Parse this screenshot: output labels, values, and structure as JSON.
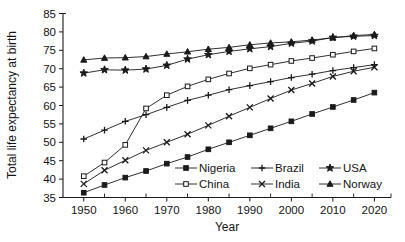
{
  "chart_data": {
    "type": "line",
    "title": "",
    "xlabel": "Year",
    "ylabel": "Total life expectancy at birth",
    "xlim": [
      1945,
      2024
    ],
    "ylim": [
      35,
      85
    ],
    "ytick_step": 5,
    "xtick_step": 10,
    "grid": false,
    "legend_position": "inside-lower-right",
    "yticks": [
      "35",
      "40",
      "45",
      "50",
      "55",
      "60",
      "65",
      "70",
      "75",
      "80",
      "85"
    ],
    "xticks": [
      "1950",
      "1960",
      "1970",
      "1980",
      "1990",
      "2000",
      "2010",
      "2020"
    ],
    "x": [
      1950,
      1955,
      1960,
      1965,
      1970,
      1975,
      1980,
      1985,
      1990,
      1995,
      2000,
      2005,
      2010,
      2015,
      2020
    ],
    "series": [
      {
        "name": "Nigeria",
        "marker": "filled-square",
        "values": [
          36.3,
          38.4,
          40.4,
          42.2,
          44.2,
          46.0,
          48.1,
          50.0,
          51.9,
          53.8,
          55.7,
          57.7,
          59.6,
          61.5,
          63.5
        ]
      },
      {
        "name": "China",
        "marker": "open-square",
        "values": [
          40.8,
          44.5,
          49.3,
          59.2,
          62.8,
          65.2,
          67.1,
          68.7,
          70.1,
          71.1,
          72.1,
          72.9,
          73.8,
          74.7,
          75.5
        ]
      },
      {
        "name": "Brazil",
        "marker": "plus",
        "values": [
          50.9,
          53.3,
          55.7,
          57.5,
          59.5,
          61.4,
          62.8,
          64.3,
          65.4,
          66.5,
          67.6,
          68.5,
          69.5,
          70.3,
          71.1
        ]
      },
      {
        "name": "India",
        "marker": "cross",
        "values": [
          38.7,
          42.4,
          45.1,
          47.8,
          50.0,
          52.2,
          54.6,
          57.1,
          59.5,
          61.9,
          64.2,
          66.0,
          67.9,
          69.3,
          70.4
        ]
      },
      {
        "name": "USA",
        "marker": "star",
        "values": [
          68.8,
          69.7,
          69.6,
          69.9,
          70.9,
          72.6,
          73.8,
          74.7,
          75.4,
          76.0,
          76.9,
          77.5,
          78.5,
          78.8,
          79.0
        ]
      },
      {
        "name": "Norway",
        "marker": "filled-triangle",
        "values": [
          72.4,
          72.9,
          73.0,
          73.3,
          74.0,
          74.6,
          75.3,
          75.8,
          76.5,
          77.0,
          77.3,
          77.8,
          78.4,
          79.0,
          79.3
        ]
      }
    ],
    "legend": [
      {
        "label": "Nigeria",
        "marker": "filled-square"
      },
      {
        "label": "Brazil",
        "marker": "plus"
      },
      {
        "label": "USA",
        "marker": "star"
      },
      {
        "label": "China",
        "marker": "open-square"
      },
      {
        "label": "India",
        "marker": "cross"
      },
      {
        "label": "Norway",
        "marker": "filled-triangle"
      }
    ],
    "colors": {
      "ink": "#1a1a1a",
      "background": "#ffffff"
    }
  }
}
